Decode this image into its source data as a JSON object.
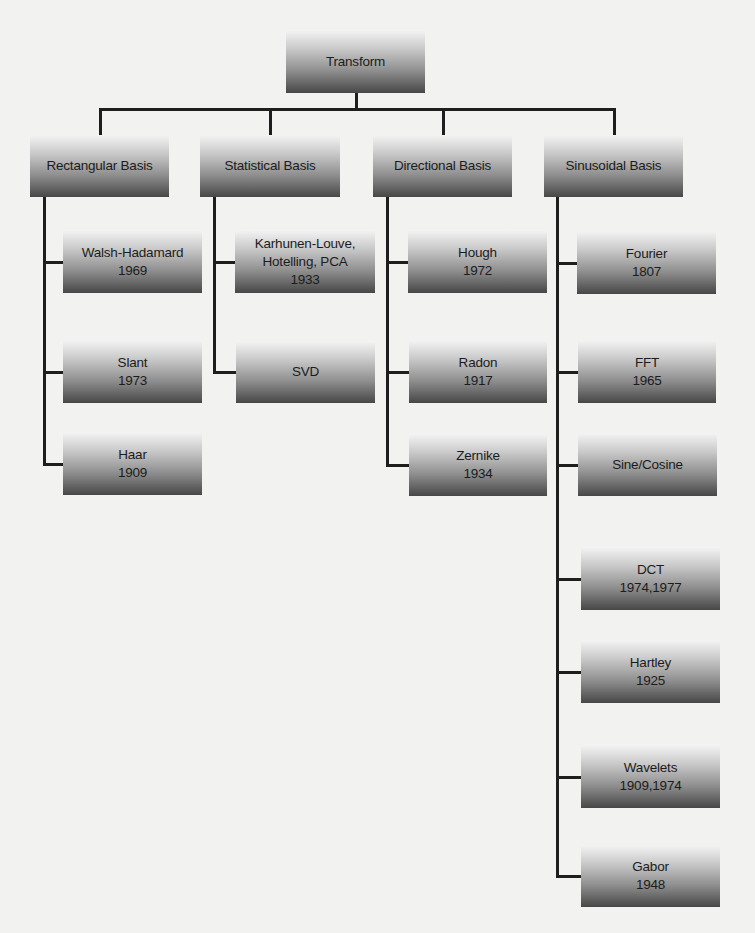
{
  "diagram": {
    "title": "Transform",
    "colors": {
      "background": "#f2f2f0",
      "line": "#1e1e1e",
      "box_top": "#f4f4f4",
      "box_bottom": "#474747",
      "text": "#1c1c1c"
    },
    "root": {
      "id": "transform",
      "label": "Transform",
      "year": "",
      "box": {
        "x": 286,
        "y": 30,
        "w": 139,
        "h": 63
      }
    },
    "categories": [
      {
        "id": "rectangular-basis",
        "label": "Rectangular Basis",
        "box": {
          "x": 30,
          "y": 135,
          "w": 139,
          "h": 62
        },
        "trunk_x": 43,
        "children": [
          {
            "id": "walsh-hadamard",
            "label": "Walsh-Hadamard",
            "year": "1969",
            "box": {
              "x": 63,
              "y": 230,
              "w": 139,
              "h": 63
            }
          },
          {
            "id": "slant",
            "label": "Slant",
            "year": "1973",
            "box": {
              "x": 63,
              "y": 340,
              "w": 139,
              "h": 63
            }
          },
          {
            "id": "haar",
            "label": "Haar",
            "year": "1909",
            "box": {
              "x": 63,
              "y": 432,
              "w": 139,
              "h": 63
            }
          }
        ]
      },
      {
        "id": "statistical-basis",
        "label": "Statistical Basis",
        "box": {
          "x": 200,
          "y": 135,
          "w": 140,
          "h": 62
        },
        "trunk_x": 213,
        "children": [
          {
            "id": "karhunen-louve",
            "label": "Karhunen-Louve,\nHotelling, PCA",
            "year": "1933",
            "box": {
              "x": 235,
              "y": 230,
              "w": 140,
              "h": 63
            }
          },
          {
            "id": "svd",
            "label": "SVD",
            "year": "",
            "box": {
              "x": 236,
              "y": 341,
              "w": 139,
              "h": 62
            }
          }
        ]
      },
      {
        "id": "directional-basis",
        "label": "Directional Basis",
        "box": {
          "x": 373,
          "y": 135,
          "w": 139,
          "h": 62
        },
        "trunk_x": 386,
        "children": [
          {
            "id": "hough",
            "label": "Hough",
            "year": "1972",
            "box": {
              "x": 408,
              "y": 230,
              "w": 139,
              "h": 63
            }
          },
          {
            "id": "radon",
            "label": "Radon",
            "year": "1917",
            "box": {
              "x": 409,
              "y": 340,
              "w": 138,
              "h": 63
            }
          },
          {
            "id": "zernike",
            "label": "Zernike",
            "year": "1934",
            "box": {
              "x": 409,
              "y": 434,
              "w": 138,
              "h": 62
            }
          }
        ]
      },
      {
        "id": "sinusoidal-basis",
        "label": "Sinusoidal Basis",
        "box": {
          "x": 544,
          "y": 135,
          "w": 139,
          "h": 62
        },
        "trunk_x": 556,
        "children": [
          {
            "id": "fourier",
            "label": "Fourier",
            "year": "1807",
            "box": {
              "x": 577,
              "y": 231,
              "w": 139,
              "h": 63
            }
          },
          {
            "id": "fft",
            "label": "FFT",
            "year": "1965",
            "box": {
              "x": 578,
              "y": 340,
              "w": 138,
              "h": 63
            }
          },
          {
            "id": "sine-cosine",
            "label": "Sine/Cosine",
            "year": "",
            "box": {
              "x": 578,
              "y": 433,
              "w": 139,
              "h": 63
            }
          },
          {
            "id": "dct",
            "label": "DCT",
            "year": "1974,1977",
            "box": {
              "x": 581,
              "y": 547,
              "w": 139,
              "h": 63
            }
          },
          {
            "id": "hartley",
            "label": "Hartley",
            "year": "1925",
            "box": {
              "x": 581,
              "y": 640,
              "w": 139,
              "h": 63
            }
          },
          {
            "id": "wavelets",
            "label": "Wavelets",
            "year": "1909,1974",
            "box": {
              "x": 581,
              "y": 745,
              "w": 139,
              "h": 63
            }
          },
          {
            "id": "gabor",
            "label": "Gabor",
            "year": "1948",
            "box": {
              "x": 581,
              "y": 845,
              "w": 139,
              "h": 62
            }
          }
        ]
      }
    ],
    "bus": {
      "y": 108,
      "x1": 97,
      "x2": 615,
      "thickness": 3
    }
  }
}
